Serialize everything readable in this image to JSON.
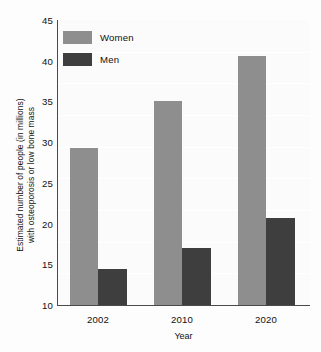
{
  "chart_data": {
    "type": "bar",
    "title": "",
    "subtitle": "",
    "xlabel": "Year",
    "ylabel": "Estimated number of people (in millions) with osteoporosis or low bone mass",
    "ylabel_lines": [
      "Estimated number of people (in millions)",
      "with osteoporosis or low bone mass"
    ],
    "categories": [
      "2002",
      "2010",
      "2020"
    ],
    "series": [
      {
        "name": "Women",
        "color": "#8e8e8e",
        "values": [
          29.3,
          35.0,
          40.6
        ]
      },
      {
        "name": "Men",
        "color": "#3e3e3e",
        "values": [
          14.4,
          17.0,
          20.7
        ]
      }
    ],
    "ylim": [
      10,
      45
    ],
    "yticks": [
      10,
      15,
      20,
      25,
      30,
      35,
      40,
      45
    ],
    "ytick_labels": [
      "10",
      "15",
      "20",
      "25",
      "30",
      "35",
      "40",
      "45"
    ],
    "xtick_labels": [
      "2002",
      "2010",
      "2020"
    ],
    "grid": false,
    "legend": {
      "position": "top-left",
      "entries": [
        {
          "label": "Women",
          "color": "#8e8e8e"
        },
        {
          "label": "Men",
          "color": "#3e3e3e"
        }
      ]
    },
    "colors": {
      "women": "#8e8e8e",
      "men": "#3e3e3e",
      "axis": "#4a4a4a",
      "plot_background": "#fbfbfb",
      "page_background": "#fdfdfd",
      "text": "#111111"
    }
  }
}
